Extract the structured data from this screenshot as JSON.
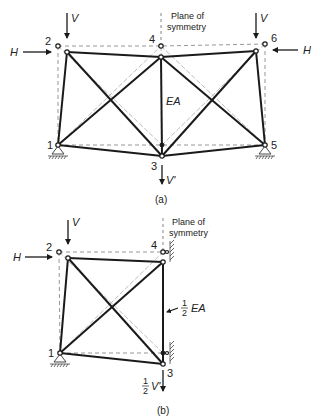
{
  "figure": {
    "panel_a": {
      "caption": "(a)",
      "symmetry_label_line1": "Plane of",
      "symmetry_label_line2": "symmetry",
      "member_label": "EA",
      "nodes": [
        "1",
        "2",
        "3",
        "4",
        "5",
        "6"
      ],
      "loads": {
        "left_vertical": "V",
        "right_vertical": "V",
        "left_horizontal": "H",
        "right_horizontal": "H",
        "bottom_vertical": "V'"
      }
    },
    "panel_b": {
      "caption": "(b)",
      "symmetry_label_line1": "Plane of",
      "symmetry_label_line2": "symmetry",
      "member_label_frac": "1/2",
      "member_label_frac_num": "1",
      "member_label_frac_den": "2",
      "member_label": "EA",
      "nodes": [
        "1",
        "2",
        "3",
        "4"
      ],
      "loads": {
        "vertical": "V",
        "horizontal": "H",
        "bottom_vertical_frac_num": "1",
        "bottom_vertical_frac_den": "2",
        "bottom_vertical": "V'"
      }
    }
  }
}
